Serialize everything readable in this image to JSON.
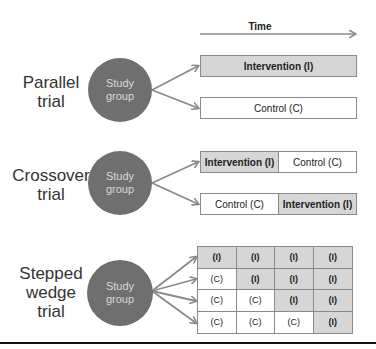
{
  "time_axis": {
    "label": "Time"
  },
  "colors": {
    "circle": "#6f6f6f",
    "intervention_fill": "#d6d6d6",
    "control_fill": "#ffffff",
    "arrow": "#8a8a8a",
    "border": "#8a8a8a"
  },
  "parallel": {
    "title_line1": "Parallel",
    "title_line2": "trial",
    "circle_line1": "Study",
    "circle_line2": "group",
    "arms": [
      {
        "label": "Intervention (I)",
        "type": "intervention"
      },
      {
        "label": "Control (C)",
        "type": "control"
      }
    ]
  },
  "crossover": {
    "title_line1": "Crossover",
    "title_line2": "trial",
    "circle_line1": "Study",
    "circle_line2": "group",
    "arms": [
      {
        "periods": [
          {
            "label": "Intervention (I)",
            "type": "intervention"
          },
          {
            "label": "Control (C)",
            "type": "control"
          }
        ]
      },
      {
        "periods": [
          {
            "label": "Control (C)",
            "type": "control"
          },
          {
            "label": "Intervention (I)",
            "type": "intervention"
          }
        ]
      }
    ]
  },
  "stepped_wedge": {
    "title_line1": "Stepped",
    "title_line2": "wedge",
    "title_line3": "trial",
    "circle_line1": "Study",
    "circle_line2": "group",
    "grid": [
      [
        "(I)",
        "(I)",
        "(I)",
        "(I)"
      ],
      [
        "(C)",
        "(I)",
        "(I)",
        "(I)"
      ],
      [
        "(C)",
        "(C)",
        "(I)",
        "(I)"
      ],
      [
        "(C)",
        "(C)",
        "(C)",
        "(I)"
      ]
    ]
  }
}
